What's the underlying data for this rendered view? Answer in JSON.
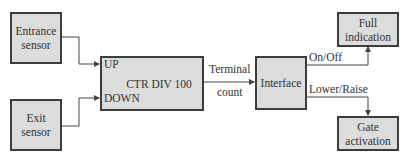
{
  "diagram": {
    "blocks": {
      "entrance_sensor": {
        "line1": "Entrance",
        "line2": "sensor"
      },
      "exit_sensor": {
        "line1": "Exit",
        "line2": "sensor"
      },
      "counter": {
        "title": "CTR DIV 100",
        "input_up": "UP",
        "input_down": "DOWN"
      },
      "interface": {
        "label": "Interface"
      },
      "full_indication": {
        "line1": "Full",
        "line2": "indication"
      },
      "gate_activation": {
        "line1": "Gate",
        "line2": "activation"
      }
    },
    "connections": {
      "terminal_count": {
        "line1": "Terminal",
        "line2": "count"
      },
      "on_off": "On/Off",
      "lower_raise": "Lower/Raise"
    },
    "colors": {
      "box_fill": "#dcdcdc",
      "box_border": "#3c3c3c",
      "wire": "#444444"
    }
  }
}
